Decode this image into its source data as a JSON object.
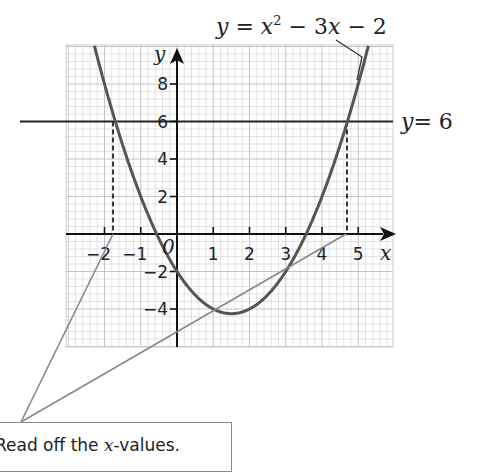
{
  "chart_data": {
    "type": "line",
    "title": "",
    "xlabel": "x",
    "ylabel": "y",
    "xlim": [
      -3.07,
      5.95
    ],
    "ylim": [
      -6.12,
      10.0
    ],
    "grid": true,
    "x_ticks": [
      -2,
      -1,
      1,
      2,
      3,
      4,
      5
    ],
    "y_ticks": [
      -4,
      -2,
      2,
      4,
      6,
      8
    ],
    "x_tick_labels": [
      "−2",
      "−1",
      "1",
      "2",
      "3",
      "4",
      "5"
    ],
    "y_tick_labels": [
      "−4",
      "−2",
      "2",
      "4",
      "6",
      "8"
    ],
    "origin_label": "0",
    "series": [
      {
        "name": "y = x² − 3x − 2",
        "kind": "curve",
        "equation": "x^2 - 3x - 2",
        "x": [
          -2,
          -1,
          0,
          1,
          1.5,
          2,
          3,
          4,
          5
        ],
        "values": [
          8,
          2,
          -2,
          -4,
          -4.25,
          -4,
          -2,
          2,
          8
        ]
      },
      {
        "name": "y = 6",
        "kind": "horizontal_line",
        "value": 6
      }
    ],
    "intersections": [
      {
        "x": -1.77,
        "y": 6
      },
      {
        "x": 4.77,
        "y": 6
      }
    ],
    "annotations": [
      {
        "text": "y = x² − 3x − 2",
        "target": "curve"
      },
      {
        "text": "y = 6",
        "target": "horizontal line"
      },
      {
        "text": "Read off the x-values.",
        "target": "intersection x-values"
      }
    ]
  },
  "labels": {
    "curve_label": "y = x² − 3x − 2",
    "line_label_y": "y",
    "line_label_eq": "= 6",
    "axis_x": "x",
    "axis_y": "y",
    "origin": "0"
  },
  "callout": {
    "text_prefix": "Read off the ",
    "text_var": "x",
    "text_suffix": "-values."
  }
}
